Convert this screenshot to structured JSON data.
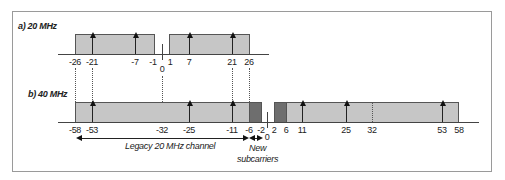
{
  "panel_a": {
    "label": "a) 20 MHz",
    "ticks": [
      {
        "text": "-26",
        "x": 75
      },
      {
        "text": "-21",
        "x": 92
      },
      {
        "text": "-7",
        "x": 135
      },
      {
        "text": "-1",
        "x": 153
      },
      {
        "text": "0",
        "x": 162
      },
      {
        "text": "1",
        "x": 170
      },
      {
        "text": "7",
        "x": 189
      },
      {
        "text": "21",
        "x": 232
      },
      {
        "text": "26",
        "x": 249
      }
    ],
    "pilots": [
      "-21",
      "-7",
      "7",
      "21"
    ]
  },
  "panel_b": {
    "label": "b) 40 MHz",
    "ticks": [
      {
        "text": "-58",
        "x": 75
      },
      {
        "text": "-53",
        "x": 92
      },
      {
        "text": "-32",
        "x": 162
      },
      {
        "text": "-25",
        "x": 189
      },
      {
        "text": "-11",
        "x": 232
      },
      {
        "text": "-6",
        "x": 249
      },
      {
        "text": "-2",
        "x": 261
      },
      {
        "text": "0",
        "x": 267
      },
      {
        "text": "2",
        "x": 274
      },
      {
        "text": "6",
        "x": 286
      },
      {
        "text": "11",
        "x": 302
      },
      {
        "text": "25",
        "x": 346
      },
      {
        "text": "32",
        "x": 372
      },
      {
        "text": "53",
        "x": 442
      },
      {
        "text": "58",
        "x": 459
      }
    ],
    "pilots": [
      "-53",
      "-25",
      "-11",
      "11",
      "25",
      "53"
    ],
    "legacy_label": "Legacy 20 MHz channel",
    "new_label_line1": "New",
    "new_label_line2": "subcarriers"
  },
  "colors": {
    "box_fill": "#c6c6c6",
    "new_subcarrier_fill": "#6e6e6e",
    "frame": "#9a9a9a"
  }
}
